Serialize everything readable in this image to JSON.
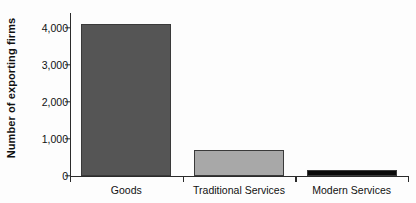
{
  "chart_data": {
    "type": "bar",
    "title": "",
    "xlabel": "",
    "ylabel": "Number of exporting firms",
    "categories": [
      "Goods",
      "Traditional Services",
      "Modern Services"
    ],
    "values": [
      4100,
      715,
      170
    ],
    "series": [
      {
        "name": "Number of exporting firms",
        "values": [
          4100,
          715,
          170
        ]
      }
    ],
    "ylim": [
      0,
      4400
    ],
    "yticks": [
      0,
      1000,
      2000,
      3000,
      4000
    ],
    "ytick_labels": [
      "0",
      "1,000",
      "2,000",
      "3,000",
      "4,000"
    ],
    "grid": false,
    "legend": false,
    "legend_position": "none",
    "bar_colors": [
      "#555555",
      "#a8a8a8",
      "#0a0a0a"
    ],
    "bar_edge_color": "#3a3a3a",
    "axis_color": "#2b2b2b",
    "background_color": "#fdfdfd",
    "text_color": "#111111"
  }
}
